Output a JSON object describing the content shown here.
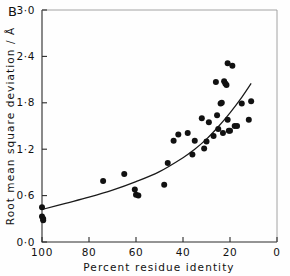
{
  "panel": {
    "label": "B"
  },
  "chart_data": {
    "type": "scatter",
    "title": "",
    "panel_label": "B",
    "xlabel": "Percent residue identity",
    "ylabel": "Root mean square deviation / Å",
    "xlim": [
      100,
      0
    ],
    "ylim": [
      0.0,
      3.0
    ],
    "x_axis_reversed": true,
    "grid": false,
    "legend": null,
    "xticks": [
      100,
      80,
      60,
      40,
      20,
      0
    ],
    "xtick_labels": [
      "100",
      "80",
      "60",
      "40",
      "20",
      "0"
    ],
    "yticks": [
      0.0,
      0.6,
      1.2,
      1.8,
      2.4,
      3.0
    ],
    "ytick_labels": [
      "0·0",
      "0·6",
      "1·2",
      "1·8",
      "2·4",
      "3·0"
    ],
    "marker": "filled-circle",
    "marker_color": "#111111",
    "points": [
      {
        "x": 100.0,
        "y": 0.45
      },
      {
        "x": 100.0,
        "y": 0.33
      },
      {
        "x": 99.5,
        "y": 0.3
      },
      {
        "x": 99.5,
        "y": 0.28
      },
      {
        "x": 74.0,
        "y": 0.79
      },
      {
        "x": 65.0,
        "y": 0.88
      },
      {
        "x": 60.5,
        "y": 0.68
      },
      {
        "x": 60.0,
        "y": 0.61
      },
      {
        "x": 59.0,
        "y": 0.6
      },
      {
        "x": 48.0,
        "y": 0.74
      },
      {
        "x": 46.5,
        "y": 1.02
      },
      {
        "x": 44.0,
        "y": 1.31
      },
      {
        "x": 42.0,
        "y": 1.39
      },
      {
        "x": 38.0,
        "y": 1.41
      },
      {
        "x": 36.0,
        "y": 1.13
      },
      {
        "x": 35.0,
        "y": 1.31
      },
      {
        "x": 32.0,
        "y": 1.6
      },
      {
        "x": 31.0,
        "y": 1.21
      },
      {
        "x": 30.0,
        "y": 1.3
      },
      {
        "x": 29.0,
        "y": 1.55
      },
      {
        "x": 27.0,
        "y": 1.37
      },
      {
        "x": 26.0,
        "y": 2.07
      },
      {
        "x": 25.5,
        "y": 1.64
      },
      {
        "x": 25.0,
        "y": 1.46
      },
      {
        "x": 24.0,
        "y": 1.79
      },
      {
        "x": 23.5,
        "y": 1.8
      },
      {
        "x": 23.0,
        "y": 1.41
      },
      {
        "x": 22.5,
        "y": 2.08
      },
      {
        "x": 22.0,
        "y": 2.05
      },
      {
        "x": 21.5,
        "y": 2.03
      },
      {
        "x": 21.0,
        "y": 2.31
      },
      {
        "x": 21.0,
        "y": 1.58
      },
      {
        "x": 20.5,
        "y": 1.44
      },
      {
        "x": 20.0,
        "y": 1.44
      },
      {
        "x": 19.0,
        "y": 2.28
      },
      {
        "x": 18.0,
        "y": 1.5
      },
      {
        "x": 17.0,
        "y": 1.5
      },
      {
        "x": 15.0,
        "y": 1.79
      },
      {
        "x": 12.0,
        "y": 1.58
      },
      {
        "x": 11.0,
        "y": 1.82
      }
    ],
    "fit_curve": {
      "description": "monotonic rising fitted curve",
      "x": [
        100,
        90,
        80,
        70,
        60,
        50,
        40,
        35,
        30,
        25,
        20,
        15,
        11
      ],
      "y": [
        0.42,
        0.5,
        0.58,
        0.67,
        0.78,
        0.91,
        1.09,
        1.2,
        1.33,
        1.49,
        1.67,
        1.87,
        2.05
      ]
    }
  }
}
